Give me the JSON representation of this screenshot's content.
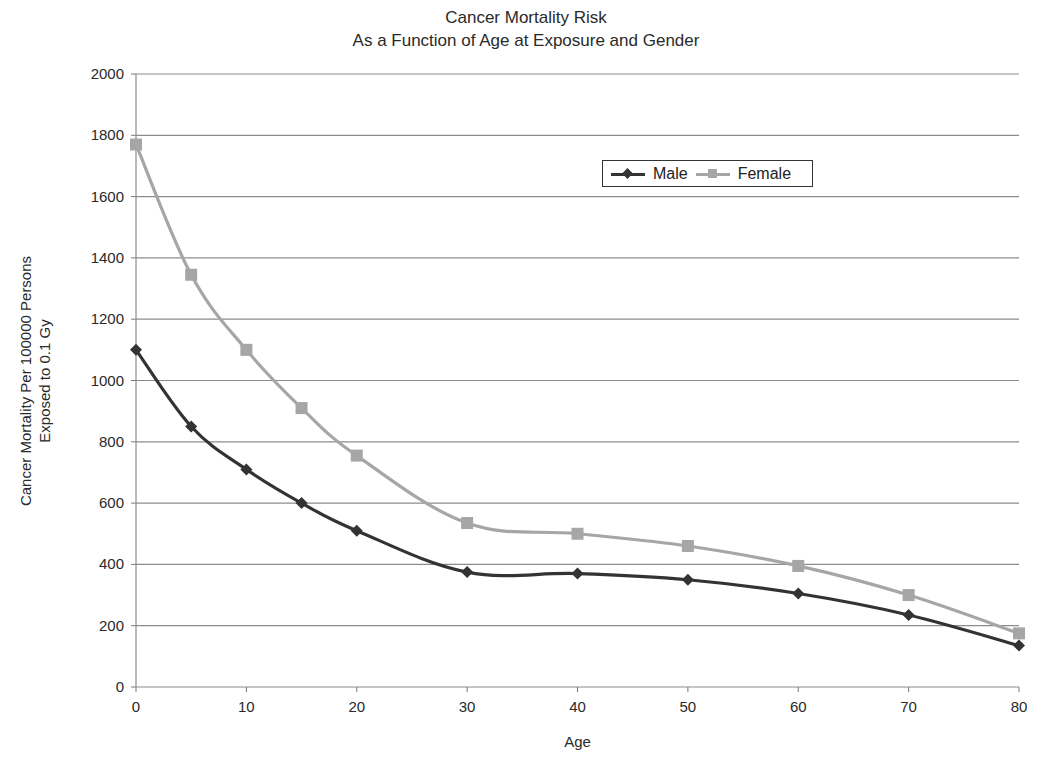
{
  "chart_data": {
    "type": "line",
    "title": "Cancer Mortality Risk",
    "subtitle": "As a Function of Age at Exposure and Gender",
    "xlabel": "Age",
    "ylabel_line1": "Cancer Mortality Per 100000 Persons",
    "ylabel_line2": "Exposed to 0.1 Gy",
    "xlim": [
      0,
      80
    ],
    "ylim": [
      0,
      2000
    ],
    "x_ticks": [
      0,
      10,
      20,
      30,
      40,
      50,
      60,
      70,
      80
    ],
    "y_ticks": [
      0,
      200,
      400,
      600,
      800,
      1000,
      1200,
      1400,
      1600,
      1800,
      2000
    ],
    "grid": "horizontal",
    "legend_position": "upper right inside",
    "x": [
      0,
      5,
      10,
      15,
      20,
      30,
      40,
      50,
      60,
      70,
      80
    ],
    "series": [
      {
        "name": "Male",
        "marker": "diamond",
        "color": "#333333",
        "values": [
          1100,
          850,
          710,
          600,
          510,
          375,
          370,
          350,
          305,
          235,
          135
        ]
      },
      {
        "name": "Female",
        "marker": "square",
        "color": "#a6a6a6",
        "values": [
          1770,
          1345,
          1100,
          910,
          755,
          535,
          500,
          460,
          395,
          300,
          175
        ]
      }
    ]
  },
  "legend": {
    "male_label": "Male",
    "female_label": "Female"
  }
}
